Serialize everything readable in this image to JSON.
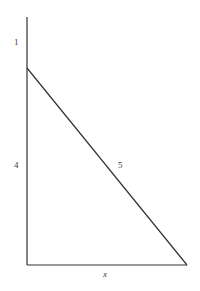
{
  "figure": {
    "background_color": "#ffffff",
    "stroke_color": "#333333",
    "text_color": "#3a3a3a",
    "stroke_width": 1.2,
    "labels": {
      "vertical_top": "1",
      "vertical_lower": "4",
      "hypotenuse": "5",
      "base": "x"
    }
  },
  "chart_data": {
    "type": "diagram",
    "xlabel": "",
    "ylabel": "",
    "shapes": [
      {
        "name": "vertical-axis-line",
        "kind": "line",
        "x1": 27,
        "y1": 17,
        "x2": 27,
        "y2": 265
      },
      {
        "name": "horizontal-base-line",
        "kind": "line",
        "x1": 27,
        "y1": 265,
        "x2": 187,
        "y2": 265
      },
      {
        "name": "hypotenuse-line",
        "kind": "line",
        "x1": 27,
        "y1": 68,
        "x2": 187,
        "y2": 265
      }
    ],
    "annotations": [
      {
        "name": "segment-length-1",
        "text": "1",
        "x": 16,
        "y": 43,
        "note": "upper vertical segment above the triangle apex"
      },
      {
        "name": "segment-length-4",
        "text": "4",
        "x": 16,
        "y": 166,
        "note": "vertical leg of triangle"
      },
      {
        "name": "segment-length-5",
        "text": "5",
        "x": 121,
        "y": 166,
        "note": "hypotenuse of triangle"
      },
      {
        "name": "segment-length-x",
        "text": "x",
        "x": 107,
        "y": 274,
        "note": "horizontal base of triangle, italic variable"
      }
    ],
    "grid": false,
    "legend": null
  }
}
